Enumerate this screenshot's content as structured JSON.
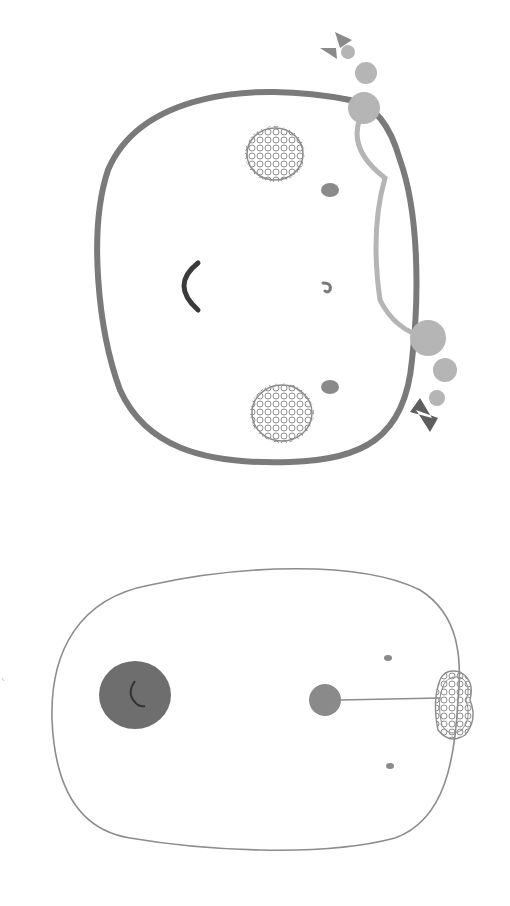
{
  "illustration": {
    "description": "Two rotated cartoon faces drawn in grayscale crayon style",
    "background": "#ffffff",
    "colors": {
      "outline_thick": "#7a7a7a",
      "outline_thin": "#8c8c8c",
      "light_gray": "#b5b5b5",
      "mid_gray": "#8a8a8a",
      "dark_gray": "#5e5e5e",
      "mouth": "#3a3a3a"
    },
    "figures": [
      {
        "name": "top-face",
        "features": [
          "blush-scribble-top",
          "blush-scribble-bottom",
          "eye-dot-top",
          "eye-dot-bottom",
          "nose",
          "mouth-arc",
          "pigtail-bow-top",
          "pigtail-bow-bottom",
          "hair-loop"
        ]
      },
      {
        "name": "bottom-face",
        "features": [
          "open-mouth",
          "nose-ball",
          "eye-dot-top",
          "eye-dot-bottom",
          "hair-bun-scribble",
          "stem-line"
        ]
      }
    ]
  }
}
